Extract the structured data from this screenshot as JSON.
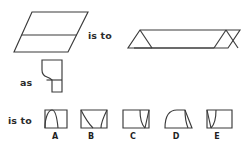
{
  "puzzle": {
    "type": "visual-analogy",
    "connectors": {
      "first": "is to",
      "middle": "as",
      "second": "is to"
    },
    "prompt_figures": [
      {
        "id": "figure-1-left",
        "name": "parallelogram-with-horizontal-divider",
        "description": "Large slanted parallelogram divided by one horizontal line into an upper band and a lower band"
      },
      {
        "id": "figure-1-right",
        "name": "flattened-parallelogram-with-end-triangles",
        "description": "Very wide flattened parallelogram with a triangle drawn at each end"
      },
      {
        "id": "figure-2-left",
        "name": "square-with-tapered-curved-foot",
        "description": "Square top with a narrow curved tapered extension descending from its lower-left"
      }
    ],
    "options": [
      {
        "letter": "A",
        "name": "rectangle-with-left-arch",
        "description": "Rectangle with a pointed arch curve rising on the left side"
      },
      {
        "letter": "B",
        "name": "rectangle-with-left-concave-sweep",
        "description": "Rectangle with a concave curve sweeping from the top-left corner down to the bottom"
      },
      {
        "letter": "C",
        "name": "rectangle-with-right-curved-wedge",
        "description": "Rectangle with a narrow curved wedge at the right end"
      },
      {
        "letter": "D",
        "name": "rounded-top-rectangle-with-right-slice",
        "description": "Rectangle with a rounded top-left dome and a curved slice near the right edge"
      },
      {
        "letter": "E",
        "name": "rectangle-with-left-curved-wedge",
        "description": "Rectangle with a narrow curved wedge at the left end"
      }
    ],
    "colors": {
      "stroke": "#3a3a3a",
      "text": "#2b2b2b",
      "background": "#ffffff"
    }
  }
}
